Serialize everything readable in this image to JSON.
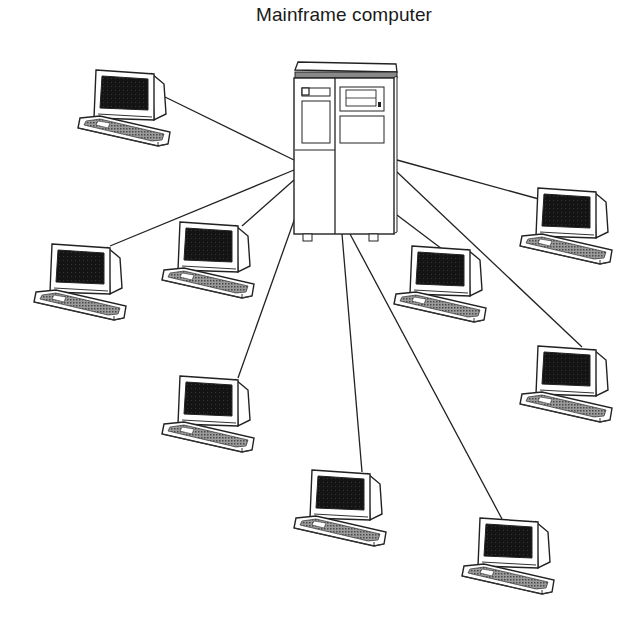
{
  "diagram": {
    "title": "Mainframe computer",
    "hub": {
      "label": "Mainframe computer",
      "type": "mainframe",
      "x": 293,
      "y": 62,
      "w": 104,
      "h": 176
    },
    "terminals": [
      {
        "id": "t1",
        "x": 78,
        "y": 70
      },
      {
        "id": "t2",
        "x": 34,
        "y": 244
      },
      {
        "id": "t3",
        "x": 162,
        "y": 222
      },
      {
        "id": "t4",
        "x": 162,
        "y": 375
      },
      {
        "id": "t5",
        "x": 294,
        "y": 468
      },
      {
        "id": "t6",
        "x": 462,
        "y": 516
      },
      {
        "id": "t7",
        "x": 394,
        "y": 245
      },
      {
        "id": "t8",
        "x": 520,
        "y": 188
      },
      {
        "id": "t9",
        "x": 520,
        "y": 345
      }
    ],
    "connections": [
      {
        "to": "t1",
        "from": [
          294,
          160
        ],
        "end": [
          165,
          97
        ]
      },
      {
        "to": "t2",
        "from": [
          294,
          170
        ],
        "end": [
          110,
          246
        ]
      },
      {
        "to": "t3",
        "from": [
          294,
          180
        ],
        "end": [
          242,
          226
        ]
      },
      {
        "to": "t4",
        "from": [
          296,
          215
        ],
        "end": [
          238,
          378
        ]
      },
      {
        "to": "t5",
        "from": [
          342,
          234
        ],
        "end": [
          362,
          472
        ]
      },
      {
        "to": "t6",
        "from": [
          350,
          234
        ],
        "end": [
          502,
          519
        ]
      },
      {
        "to": "t7",
        "from": [
          397,
          215
        ],
        "end": [
          442,
          249
        ]
      },
      {
        "to": "t8",
        "from": [
          397,
          160
        ],
        "end": [
          546,
          201
        ]
      },
      {
        "to": "t9",
        "from": [
          397,
          172
        ],
        "end": [
          582,
          347
        ]
      }
    ],
    "colors": {
      "line": "#222222",
      "screen": "#1c1c1c",
      "keys": "#7a7a7a",
      "background": "#ffffff"
    }
  }
}
